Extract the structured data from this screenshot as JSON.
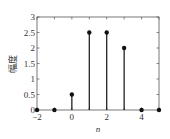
{
  "chart_data": {
    "type": "stem",
    "title": "",
    "xlabel": "n",
    "ylabel": "幅度",
    "x": [
      -2,
      -1,
      0,
      1,
      2,
      3,
      4,
      5
    ],
    "values": [
      0,
      0,
      0.5,
      2.5,
      2.5,
      2,
      0,
      0
    ],
    "xlim": [
      -2,
      5
    ],
    "ylim": [
      0,
      3
    ],
    "xticks": [
      "-2",
      "0",
      "2",
      "4"
    ],
    "yticks": [
      "0",
      "0.5",
      "1",
      "1.5",
      "2",
      "2.5",
      "3"
    ],
    "grid": false,
    "legend": null,
    "color": "#111111"
  }
}
